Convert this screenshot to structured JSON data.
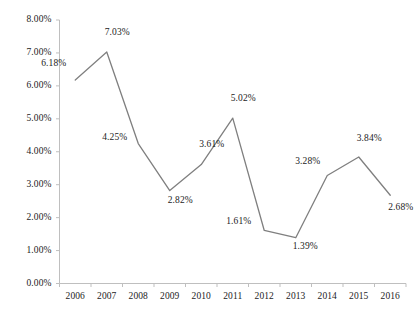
{
  "chart_data": {
    "type": "line",
    "title": "",
    "subtitle": "",
    "xlabel": "",
    "ylabel": "",
    "categories": [
      "2006",
      "2007",
      "2008",
      "2009",
      "2010",
      "2011",
      "2012",
      "2013",
      "2014",
      "2015",
      "2016"
    ],
    "values": [
      6.18,
      7.03,
      4.25,
      2.82,
      3.61,
      5.02,
      1.61,
      1.39,
      3.28,
      3.84,
      2.68
    ],
    "point_labels": [
      "6.18%",
      "7.03%",
      "4.25%",
      "2.82%",
      "3.61%",
      "5.02%",
      "1.61%",
      "1.39%",
      "3.28%",
      "3.84%",
      "2.68%"
    ],
    "ylim": [
      0,
      8
    ],
    "ytick_values": [
      0,
      1,
      2,
      3,
      4,
      5,
      6,
      7,
      8
    ],
    "ytick_labels": [
      "0.00%",
      "1.00%",
      "2.00%",
      "3.00%",
      "4.00%",
      "5.00%",
      "6.00%",
      "7.00%",
      "8.00%"
    ],
    "grid": false,
    "legend": false,
    "legend_position": "none",
    "series_name": "",
    "line_color": "#7f7f7f",
    "axis_color": "#bfbfbf",
    "text_color": "#1c1c1c",
    "background_color": "#ffffff",
    "markers": false
  }
}
